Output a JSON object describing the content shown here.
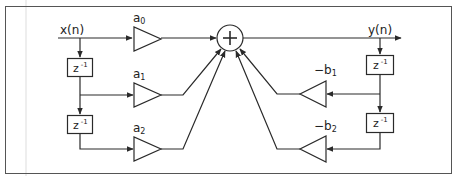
{
  "diagram": {
    "type": "block-diagram",
    "colors": {
      "stroke": "#2a2a2a",
      "frame": "#555555",
      "guide": "#dddddd",
      "background": "#ffffff",
      "text": "#222222"
    },
    "input": {
      "label": "x(n)"
    },
    "output": {
      "label": "y(n)"
    },
    "summer": {
      "symbol": "+"
    },
    "delay_label": {
      "base": "z",
      "exp": "-1"
    },
    "feedforward_gains": [
      {
        "base": "a",
        "sub": "0"
      },
      {
        "base": "a",
        "sub": "1"
      },
      {
        "base": "a",
        "sub": "2"
      }
    ],
    "feedback_gains": [
      {
        "base": "−b",
        "sub": "1"
      },
      {
        "base": "−b",
        "sub": "2"
      }
    ]
  }
}
